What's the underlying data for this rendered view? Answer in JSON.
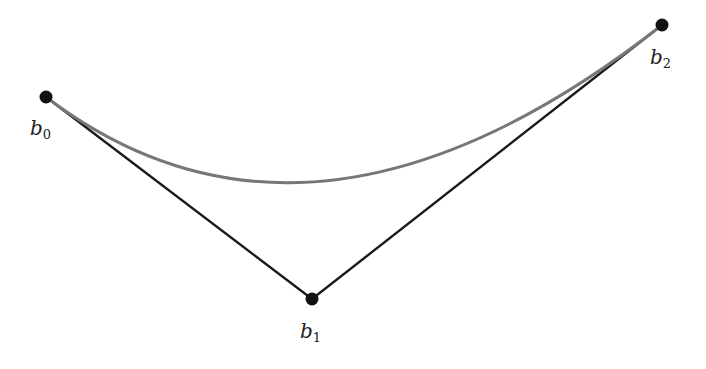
{
  "diagram": {
    "type": "quadratic-bezier",
    "points": [
      {
        "id": "b0",
        "base": "b",
        "sub": "0",
        "x": 46,
        "y": 97,
        "label_x": 30,
        "label_y": 135
      },
      {
        "id": "b1",
        "base": "b",
        "sub": "1",
        "x": 312,
        "y": 299,
        "label_x": 300,
        "label_y": 338
      },
      {
        "id": "b2",
        "base": "b",
        "sub": "2",
        "x": 662,
        "y": 25,
        "label_x": 650,
        "label_y": 64
      }
    ],
    "colors": {
      "control_polygon": "#1a1a1a",
      "curve": "#777777",
      "point": "#111111"
    }
  }
}
